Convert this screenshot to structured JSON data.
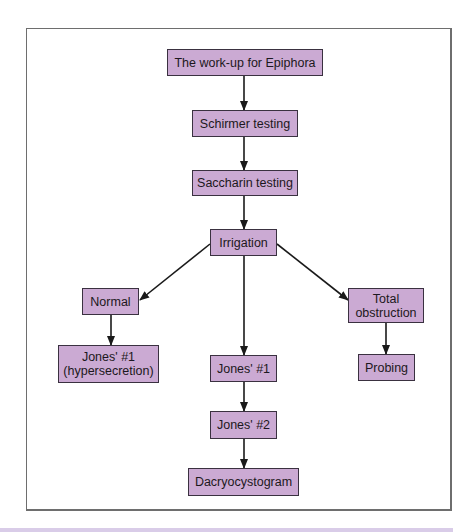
{
  "diagram": {
    "type": "flowchart",
    "colors": {
      "node_fill": "#cbaad3",
      "node_border": "#3a3140",
      "arrow": "#1a1a1a",
      "frame_border": "#6e6e6e",
      "bottom_band": "#d9cce8"
    },
    "nodes": [
      {
        "id": "workup",
        "label": "The work-up for Epiphora"
      },
      {
        "id": "schirmer",
        "label": "Schirmer testing"
      },
      {
        "id": "saccharin",
        "label": "Saccharin testing"
      },
      {
        "id": "irrigation",
        "label": "Irrigation"
      },
      {
        "id": "normal",
        "label": "Normal"
      },
      {
        "id": "total_obstruction",
        "label": "Total\nobstruction"
      },
      {
        "id": "jones1_hyper",
        "label": "Jones' #1\n(hypersecretion)"
      },
      {
        "id": "jones1",
        "label": "Jones' #1"
      },
      {
        "id": "probing",
        "label": "Probing"
      },
      {
        "id": "jones2",
        "label": "Jones' #2"
      },
      {
        "id": "dacryocystogram",
        "label": "Dacryocystogram"
      }
    ],
    "edges": [
      {
        "from": "workup",
        "to": "schirmer"
      },
      {
        "from": "schirmer",
        "to": "saccharin"
      },
      {
        "from": "saccharin",
        "to": "irrigation"
      },
      {
        "from": "irrigation",
        "to": "normal"
      },
      {
        "from": "irrigation",
        "to": "jones1"
      },
      {
        "from": "irrigation",
        "to": "total_obstruction"
      },
      {
        "from": "normal",
        "to": "jones1_hyper"
      },
      {
        "from": "total_obstruction",
        "to": "probing"
      },
      {
        "from": "jones1",
        "to": "jones2"
      },
      {
        "from": "jones2",
        "to": "dacryocystogram"
      }
    ]
  }
}
